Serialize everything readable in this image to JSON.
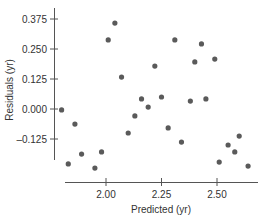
{
  "chart_data": {
    "type": "scatter",
    "title": "",
    "xlabel": "Predicted (yr)",
    "ylabel": "Residuals (yr)",
    "xticks": [
      2.0,
      2.25,
      2.5
    ],
    "xtick_labels": [
      "2.00",
      "2.25",
      "2.50"
    ],
    "yticks": [
      0.375,
      0.25,
      0.125,
      0.0,
      -0.125
    ],
    "ytick_labels": [
      "0.375",
      "0.250",
      "0.125",
      "0.000",
      "–0.125"
    ],
    "xlim": [
      1.79,
      2.68
    ],
    "ylim": [
      -0.26,
      0.38
    ],
    "grid": false,
    "legend": null,
    "marker_color": "#5a5a5a",
    "points": [
      {
        "x": 1.8,
        "y": -0.004
      },
      {
        "x": 1.83,
        "y": -0.229
      },
      {
        "x": 1.86,
        "y": -0.063
      },
      {
        "x": 1.89,
        "y": -0.188
      },
      {
        "x": 1.95,
        "y": -0.246
      },
      {
        "x": 1.98,
        "y": -0.179
      },
      {
        "x": 2.01,
        "y": 0.288
      },
      {
        "x": 2.04,
        "y": 0.358
      },
      {
        "x": 2.07,
        "y": 0.133
      },
      {
        "x": 2.1,
        "y": -0.1
      },
      {
        "x": 2.13,
        "y": -0.029
      },
      {
        "x": 2.16,
        "y": 0.042
      },
      {
        "x": 2.19,
        "y": 0.008
      },
      {
        "x": 2.22,
        "y": 0.179
      },
      {
        "x": 2.25,
        "y": 0.05
      },
      {
        "x": 2.28,
        "y": -0.079
      },
      {
        "x": 2.31,
        "y": 0.288
      },
      {
        "x": 2.34,
        "y": -0.138
      },
      {
        "x": 2.38,
        "y": 0.033
      },
      {
        "x": 2.4,
        "y": 0.196
      },
      {
        "x": 2.43,
        "y": 0.271
      },
      {
        "x": 2.45,
        "y": 0.042
      },
      {
        "x": 2.49,
        "y": 0.208
      },
      {
        "x": 2.51,
        "y": -0.221
      },
      {
        "x": 2.55,
        "y": -0.15
      },
      {
        "x": 2.58,
        "y": -0.179
      },
      {
        "x": 2.6,
        "y": -0.113
      },
      {
        "x": 2.64,
        "y": -0.238
      }
    ]
  }
}
